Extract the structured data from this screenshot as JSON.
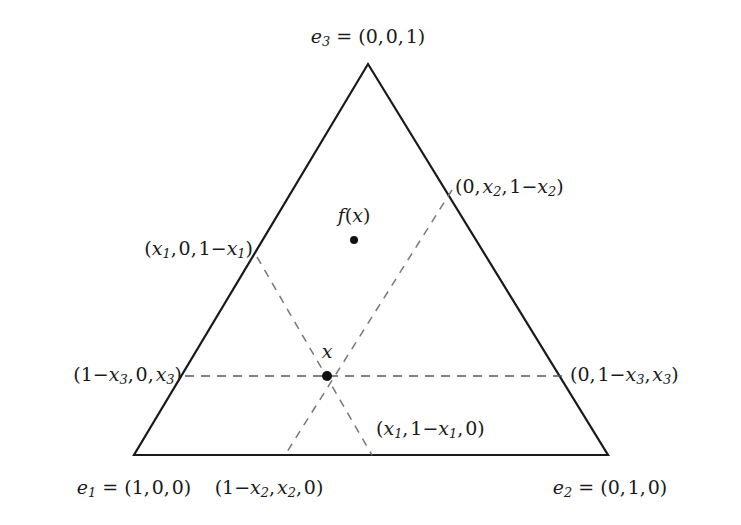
{
  "figure": {
    "type": "simplex-diagram",
    "background_color": "#ffffff",
    "line_color": "#1a1a1a",
    "dash_color": "#555555"
  },
  "geometry": {
    "triangle": {
      "apex": {
        "x": 368,
        "y": 64
      },
      "bottom_left": {
        "x": 134,
        "y": 455
      },
      "bottom_right": {
        "x": 608,
        "y": 455
      }
    },
    "points": {
      "x": {
        "x": 327,
        "y": 376,
        "radius": 5
      },
      "f_of_x": {
        "x": 354,
        "y": 240,
        "radius": 4
      }
    },
    "dashed_lines": [
      {
        "name": "line-x3-horizontal",
        "x1": 185,
        "y1": 376,
        "x2": 566,
        "y2": 376
      },
      {
        "name": "line-x1-upperleft-to-lowerright",
        "x1": 257,
        "y1": 257,
        "x2": 372,
        "y2": 455
      },
      {
        "name": "line-x2-upperright-to-lowerleft",
        "x1": 452,
        "y1": 190,
        "x2": 285,
        "y2": 455
      }
    ]
  },
  "labels": {
    "vertex_top": {
      "name": "e3",
      "text": "e3 = (0, 0, 1)",
      "var": "e",
      "sub": "3",
      "eq": " = (0, 0, 1)",
      "x": 368,
      "y": 38
    },
    "vertex_bottom_left": {
      "name": "e1",
      "text": "e1 = (1, 0, 0)",
      "var": "e",
      "sub": "1",
      "eq": " = (1, 0, 0)",
      "x": 134,
      "y": 489
    },
    "vertex_bottom_right": {
      "name": "e2",
      "text": "e2 = (0, 1, 0)",
      "var": "e",
      "sub": "2",
      "eq": " = (0, 1, 0)",
      "x": 610,
      "y": 489
    },
    "edge_left_upper": {
      "name": "x1-edge-left",
      "text": "(x1, 0, 1-x1)",
      "x": 253,
      "y": 250
    },
    "edge_right_upper": {
      "name": "x2-edge-right",
      "text": "(0, x2, 1-x2)",
      "x": 455,
      "y": 188
    },
    "edge_left_middle": {
      "name": "x3-edge-left",
      "text": "(1-x3, 0, x3)",
      "x": 182,
      "y": 376
    },
    "edge_right_middle": {
      "name": "x3-edge-right",
      "text": "(0, 1-x3, x3)",
      "x": 570,
      "y": 376
    },
    "edge_bottom_left": {
      "name": "x2-edge-bottom",
      "text": "(1-x2, x2, 0)",
      "x": 269,
      "y": 489
    },
    "edge_bottom_right": {
      "name": "x1-edge-bottom",
      "text": "(x1, 1-x1, 0)",
      "x": 376,
      "y": 430
    },
    "point_x": {
      "name": "x",
      "text": "x",
      "x": 327,
      "y": 351
    },
    "point_fx": {
      "name": "f(x)",
      "text": "f(x)",
      "x": 354,
      "y": 215
    }
  }
}
